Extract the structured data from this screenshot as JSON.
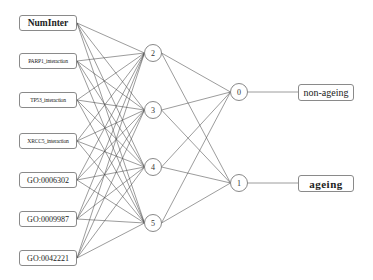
{
  "diagram": {
    "type": "neural-network",
    "input_layer": [
      {
        "id": "in0",
        "label": "NumInter",
        "y": 23
      },
      {
        "id": "in1",
        "label": "PARP1_interaction",
        "y": 61
      },
      {
        "id": "in2",
        "label": "TP53_interaction",
        "y": 100
      },
      {
        "id": "in3",
        "label": "XRCC5_interaction",
        "y": 141
      },
      {
        "id": "in4",
        "label": "GO:0006302",
        "y": 180
      },
      {
        "id": "in5",
        "label": "GO:0009987",
        "y": 219
      },
      {
        "id": "in6",
        "label": "GO:0042221",
        "y": 258
      }
    ],
    "hidden_layer": [
      {
        "id": "h2",
        "label": "2",
        "x": 153,
        "y": 53
      },
      {
        "id": "h3",
        "label": "3",
        "x": 153,
        "y": 110
      },
      {
        "id": "h4",
        "label": "4",
        "x": 153,
        "y": 167
      },
      {
        "id": "h5",
        "label": "5",
        "x": 153,
        "y": 223
      }
    ],
    "output_layer": [
      {
        "id": "o0",
        "label": "0",
        "x": 239,
        "y": 92
      },
      {
        "id": "o1",
        "label": "1",
        "x": 239,
        "y": 183
      }
    ],
    "output_labels": [
      {
        "label": "non-ageing",
        "y": 92
      },
      {
        "label": "ageing",
        "y": 183
      }
    ],
    "connections": "fully-connected input->hidden->output"
  }
}
